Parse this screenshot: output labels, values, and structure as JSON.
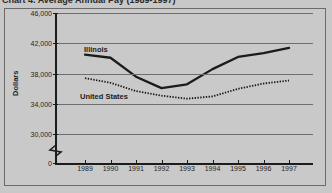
{
  "caption": "Chart 4. Average Annual Pay (1989-1997)",
  "chart_data": {
    "type": "line",
    "title": "",
    "xlabel": "",
    "ylabel": "Dollars",
    "x": [
      "1989",
      "1990",
      "1991",
      "1992",
      "1993",
      "1994",
      "1995",
      "1996",
      "1997"
    ],
    "ylim": [
      30000,
      46000
    ],
    "yticks": [
      "0",
      "30,000",
      "34,000",
      "38,000",
      "42,000",
      "46,000"
    ],
    "ytick_values": [
      0,
      30000,
      34000,
      38000,
      42000,
      46000
    ],
    "y_axis_break": true,
    "grid": true,
    "legend_position": "inline-annotation",
    "series": [
      {
        "name": "Illinois",
        "style": "solid",
        "color": "#1b1b1b",
        "values": [
          40500,
          40100,
          37600,
          36100,
          36600,
          38600,
          40200,
          40700,
          41400
        ]
      },
      {
        "name": "United States",
        "style": "dotted",
        "color": "#1b1b1b",
        "values": [
          37400,
          36800,
          35700,
          35100,
          34700,
          35000,
          36000,
          36700,
          37100
        ]
      }
    ]
  },
  "colors": {
    "background": "#c8c8c8",
    "plot_background": "#c9c9c9",
    "axis": "#1c1c1c",
    "grid": "#6e6e6e",
    "frame": "#6b6b6b"
  }
}
